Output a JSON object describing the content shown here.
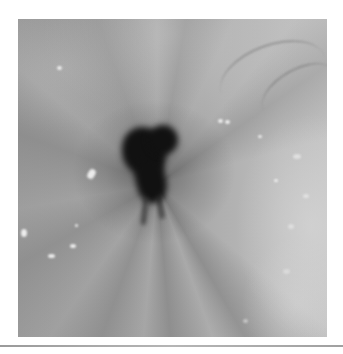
{
  "figure": {
    "type": "grayscale endoscopic photograph",
    "caption": ""
  },
  "colors": {
    "background": "#ffffff",
    "lumen": "#111111",
    "mucosa_mid": "#a8a8a8",
    "mucosa_bright": "#c4c4c4",
    "divider": "#a8a8a8"
  }
}
